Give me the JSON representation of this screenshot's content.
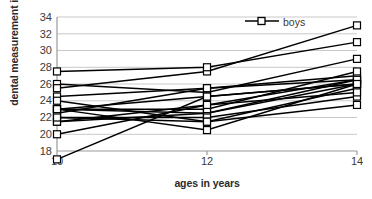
{
  "chart_data": {
    "type": "line",
    "title": "",
    "xlabel": "ages in years",
    "ylabel": "dental measurement in mm",
    "x": [
      10,
      12,
      14
    ],
    "xticks": [
      "10",
      "12",
      "14"
    ],
    "yticks": [
      "18",
      "20",
      "22",
      "24",
      "26",
      "28",
      "30",
      "32",
      "34"
    ],
    "xlim": [
      10,
      14
    ],
    "ylim": [
      18,
      34
    ],
    "grid": true,
    "grid_axis": "y",
    "legend": [
      "boys"
    ],
    "legend_position": "top-right-inside",
    "marker": "open-square",
    "line_color": "#000000",
    "series": [
      {
        "name": "boy-01",
        "values": [
          26.0,
          25.0,
          29.0
        ]
      },
      {
        "name": "boy-02",
        "values": [
          21.5,
          22.5,
          26.5
        ]
      },
      {
        "name": "boy-03",
        "values": [
          23.0,
          22.5,
          26.0
        ]
      },
      {
        "name": "boy-04",
        "values": [
          25.5,
          27.5,
          33.0
        ]
      },
      {
        "name": "boy-05",
        "values": [
          20.0,
          23.5,
          26.5
        ]
      },
      {
        "name": "boy-06",
        "values": [
          24.5,
          25.5,
          27.0
        ]
      },
      {
        "name": "boy-07",
        "values": [
          22.0,
          22.0,
          24.5
        ]
      },
      {
        "name": "boy-08",
        "values": [
          24.0,
          21.5,
          25.5
        ]
      },
      {
        "name": "boy-09",
        "values": [
          23.0,
          20.5,
          26.0
        ]
      },
      {
        "name": "boy-10",
        "values": [
          27.5,
          28.0,
          31.0
        ]
      },
      {
        "name": "boy-11",
        "values": [
          23.0,
          23.0,
          27.5
        ]
      },
      {
        "name": "boy-12",
        "values": [
          21.5,
          23.5,
          25.0
        ]
      },
      {
        "name": "boy-13",
        "values": [
          17.0,
          24.5,
          26.0
        ]
      },
      {
        "name": "boy-14",
        "values": [
          22.5,
          25.5,
          26.5
        ]
      },
      {
        "name": "boy-15",
        "values": [
          23.0,
          24.5,
          26.0
        ]
      },
      {
        "name": "boy-16",
        "values": [
          22.0,
          21.5,
          23.5
        ]
      }
    ]
  },
  "axis": {
    "y_title": "dental measurement in mm",
    "x_title": "ages in years"
  },
  "legend": {
    "entry_label": "boys",
    "marker_name": "open-square-marker"
  }
}
